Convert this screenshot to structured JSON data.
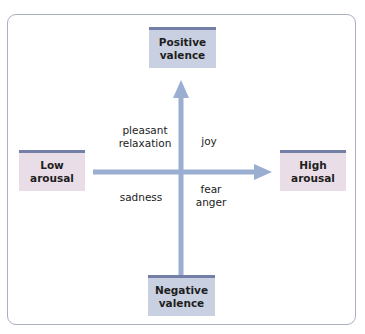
{
  "diagram": {
    "type": "two-dimensional emotion space (valence × arousal)",
    "colors": {
      "frame_border": "#a9afc0",
      "valence_box_fill": "#c9d0e1",
      "arousal_box_fill": "#e9dde7",
      "box_top_bar": "#737fa6",
      "axis_arrow": "#9aaed2"
    },
    "poles": {
      "top": {
        "line1": "Positive",
        "line2": "valence"
      },
      "bottom": {
        "line1": "Negative",
        "line2": "valence"
      },
      "left": {
        "line1": "Low",
        "line2": "arousal"
      },
      "right": {
        "line1": "High",
        "line2": "arousal"
      }
    },
    "quadrants": {
      "upper_left": {
        "line1": "pleasant",
        "line2": "relaxation"
      },
      "upper_right": {
        "line1": "joy"
      },
      "lower_left": {
        "line1": "sadness"
      },
      "lower_right": {
        "line1": "fear",
        "line2": "anger"
      }
    },
    "axes": {
      "vertical": {
        "direction": "up",
        "label_from": "Negative valence",
        "label_to": "Positive valence"
      },
      "horizontal": {
        "direction": "right",
        "label_from": "Low arousal",
        "label_to": "High arousal"
      }
    }
  }
}
